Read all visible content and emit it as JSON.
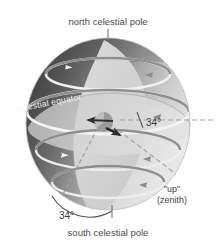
{
  "figure": {
    "labels": {
      "north_pole": "north celestial pole",
      "south_pole": "south celestial pole",
      "celestial_equator": "celestial equator",
      "zenith_quoted": "\"up\"",
      "zenith_paren": "(zenith)",
      "angle_upper": "34°",
      "angle_lower": "34°"
    },
    "colors": {
      "background": "#ffffff",
      "text": "#4a4a4a",
      "text_on_sphere": "#f4f4f4",
      "sphere_dark": "#4d4d4d",
      "sphere_mid": "#8f8f8f",
      "sphere_light": "#e0e0e0",
      "horizon_plane": "#cfcfcf",
      "meridian_band": "#d8d8d8",
      "ring_gray": "#8c8c8c",
      "ring_white": "#f2f2f2",
      "leader_line": "#7a7a7a",
      "dashed_line": "#9a9a9a",
      "observer": "#3a3a3a"
    },
    "elements": {
      "rings_count": 5,
      "arrow_direction": "counterclockwise",
      "latitude_degrees": 34
    }
  }
}
